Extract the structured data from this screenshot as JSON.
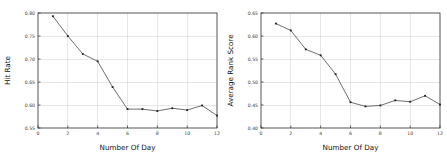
{
  "figure": {
    "background_color": "#ffffff",
    "width": 447,
    "height": 167,
    "panel_count": 2
  },
  "style": {
    "line_color": "#555555",
    "marker_color": "#1c1c1c",
    "grid_color": "#d0d0d0",
    "axis_color": "#2b2b2b",
    "text_color": "#111111"
  },
  "chart_data": [
    {
      "type": "line",
      "panel": "left",
      "title": "",
      "xlabel": "Number Of Day",
      "ylabel": "Hit Rate",
      "xlim": [
        0,
        12
      ],
      "ylim": [
        0.55,
        0.8
      ],
      "grid": true,
      "legend": "none",
      "xticks": [
        0,
        2,
        4,
        6,
        8,
        10,
        12
      ],
      "xticklabels": [
        "0",
        "2",
        "4",
        "6",
        "8",
        "10",
        "12"
      ],
      "yticks": [
        0.55,
        0.6,
        0.65,
        0.7,
        0.75,
        0.8
      ],
      "yticklabels": [
        "0.55",
        "0.60",
        "0.65",
        "0.70",
        "0.75",
        "0.80"
      ],
      "x": [
        1,
        2,
        3,
        4,
        5,
        6,
        7,
        8,
        9,
        10,
        11,
        12
      ],
      "values": [
        0.793,
        0.75,
        0.711,
        0.695,
        0.639,
        0.591,
        0.591,
        0.587,
        0.593,
        0.589,
        0.599,
        0.577
      ],
      "markers": true
    },
    {
      "type": "line",
      "panel": "right",
      "title": "",
      "xlabel": "Number Of Day",
      "ylabel": "Average Rank Score",
      "xlim": [
        0,
        12
      ],
      "ylim": [
        0.4,
        0.65
      ],
      "grid": true,
      "legend": "none",
      "xticks": [
        0,
        2,
        4,
        6,
        8,
        10,
        12
      ],
      "xticklabels": [
        "0",
        "2",
        "4",
        "6",
        "8",
        "10",
        "12"
      ],
      "yticks": [
        0.4,
        0.45,
        0.5,
        0.55,
        0.6,
        0.65
      ],
      "yticklabels": [
        "0.40",
        "0.45",
        "0.50",
        "0.55",
        "0.60",
        "0.65"
      ],
      "x": [
        1,
        2,
        3,
        4,
        5,
        6,
        7,
        8,
        9,
        10,
        11,
        12
      ],
      "values": [
        0.627,
        0.612,
        0.571,
        0.558,
        0.517,
        0.456,
        0.447,
        0.449,
        0.46,
        0.457,
        0.47,
        0.451
      ],
      "markers": true
    }
  ]
}
